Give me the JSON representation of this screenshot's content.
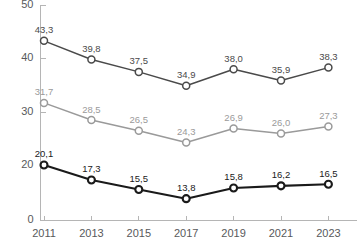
{
  "chart_data": {
    "type": "line",
    "title": "",
    "subtitle": "",
    "xlabel": "",
    "ylabel": "",
    "categories": [
      "2011",
      "2013",
      "2015",
      "2017",
      "2019",
      "2021",
      "2023"
    ],
    "x": [
      2011,
      2013,
      2015,
      2017,
      2019,
      2021,
      2023
    ],
    "series": [
      {
        "name": "series-1-upper",
        "color": "#4a4a4a",
        "values": [
          43.3,
          39.8,
          37.5,
          34.9,
          38.0,
          35.9,
          38.3
        ],
        "labels": [
          "43,3",
          "39,8",
          "37,5",
          "34,9",
          "38,0",
          "35,9",
          "38,3"
        ]
      },
      {
        "name": "series-2-middle",
        "color": "#9a9a9a",
        "values": [
          31.7,
          28.5,
          26.5,
          24.3,
          26.9,
          26.0,
          27.3
        ],
        "labels": [
          "31,7",
          "28,5",
          "26,5",
          "24,3",
          "26,9",
          "26,0",
          "27,3"
        ]
      },
      {
        "name": "series-3-lower",
        "color": "#1a1a1a",
        "values": [
          20.1,
          17.3,
          15.5,
          13.8,
          15.8,
          16.2,
          16.5
        ],
        "labels": [
          "20,1",
          "17,3",
          "15,5",
          "13,8",
          "15,8",
          "16,2",
          "16,5"
        ]
      }
    ],
    "yticks": [
      0,
      20,
      30,
      40,
      50
    ],
    "ytick_labels": [
      "0",
      "20",
      "30",
      "40",
      "50"
    ],
    "ylim": [
      0,
      50
    ],
    "broken_axis": true,
    "grid": false,
    "legend": "none",
    "decimal_separator": ",",
    "marker": "open-circle",
    "colors": {
      "axis": "#b5b5b5",
      "tick_text": "#58595b",
      "background": "#ffffff"
    }
  }
}
